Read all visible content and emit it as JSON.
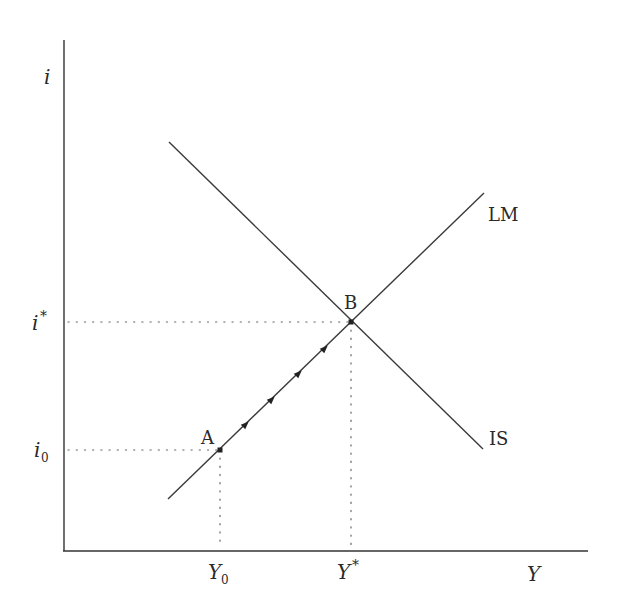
{
  "diagram": {
    "type": "IS-LM diagram",
    "axes": {
      "y_label": "i",
      "x_label": "Y"
    },
    "curves": [
      {
        "name": "IS",
        "label": "IS",
        "slope": "downward"
      },
      {
        "name": "LM",
        "label": "LM",
        "slope": "upward"
      }
    ],
    "points": [
      {
        "id": "A",
        "label": "A",
        "x_label": "Y",
        "x_sub": "0",
        "y_label": "i",
        "y_sub": "0"
      },
      {
        "id": "B",
        "label": "B",
        "x_label": "Y*",
        "y_label": "i*"
      }
    ],
    "y_ticks": {
      "i_star": {
        "base": "i",
        "sup": "*"
      },
      "i_zero": {
        "base": "i",
        "sub": "0"
      }
    },
    "x_ticks": {
      "y_zero": {
        "base": "Y",
        "sub": "0"
      },
      "y_star": {
        "base": "Y",
        "sup": "*"
      }
    },
    "arrows": {
      "count": 4,
      "direction": "along LM from A toward B"
    },
    "colors": {
      "line": "#333333",
      "background": "#ffffff"
    }
  }
}
